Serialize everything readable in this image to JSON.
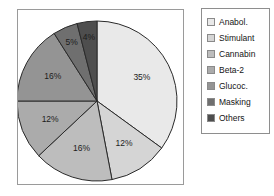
{
  "chart_data": {
    "type": "pie",
    "title": "",
    "subtitle": "",
    "xlabel": "",
    "ylabel": "",
    "grid": false,
    "legend_position": "right",
    "start_angle_deg": 0,
    "direction": "clockwise",
    "units": "percent",
    "total": 100,
    "categories": [
      "Anabol.",
      "Stimulant",
      "Cannabin",
      "Beta-2",
      "Glucoc.",
      "Masking",
      "Others"
    ],
    "values": [
      35,
      12,
      16,
      12,
      16,
      5,
      4
    ],
    "data_labels": [
      "35%",
      "12%",
      "16%",
      "12%",
      "16%",
      "5%",
      "4%"
    ],
    "colors": [
      "#e9e9e9",
      "#d5d5d5",
      "#bdbdbd",
      "#ababab",
      "#949494",
      "#6f6f6f",
      "#4e4e4e"
    ],
    "slices": [
      {
        "label": "Anabol.",
        "value": 35,
        "data_label": "35%",
        "color": "#e9e9e9"
      },
      {
        "label": "Stimulant",
        "value": 12,
        "data_label": "12%",
        "color": "#d5d5d5"
      },
      {
        "label": "Cannabin",
        "value": 16,
        "data_label": "16%",
        "color": "#bdbdbd"
      },
      {
        "label": "Beta-2",
        "value": 12,
        "data_label": "12%",
        "color": "#ababab"
      },
      {
        "label": "Glucoc.",
        "value": 16,
        "data_label": "16%",
        "color": "#949494"
      },
      {
        "label": "Masking",
        "value": 5,
        "data_label": "5%",
        "color": "#6f6f6f"
      },
      {
        "label": "Others",
        "value": 4,
        "data_label": "4%",
        "color": "#4e4e4e"
      }
    ]
  },
  "legend": {
    "items": [
      {
        "label": "Anabol.",
        "color": "#e9e9e9"
      },
      {
        "label": "Stimulant",
        "color": "#d5d5d5"
      },
      {
        "label": "Cannabin",
        "color": "#bdbdbd"
      },
      {
        "label": "Beta-2",
        "color": "#ababab"
      },
      {
        "label": "Glucoc.",
        "color": "#949494"
      },
      {
        "label": "Masking",
        "color": "#6f6f6f"
      },
      {
        "label": "Others",
        "color": "#4e4e4e"
      }
    ]
  },
  "style": {
    "slice_outline": "#2a2a2a",
    "frame_border": "#9a9a9a",
    "legend_border": "#8e8e8e",
    "background": "#ffffff",
    "label_text": "#1c1c1c"
  }
}
